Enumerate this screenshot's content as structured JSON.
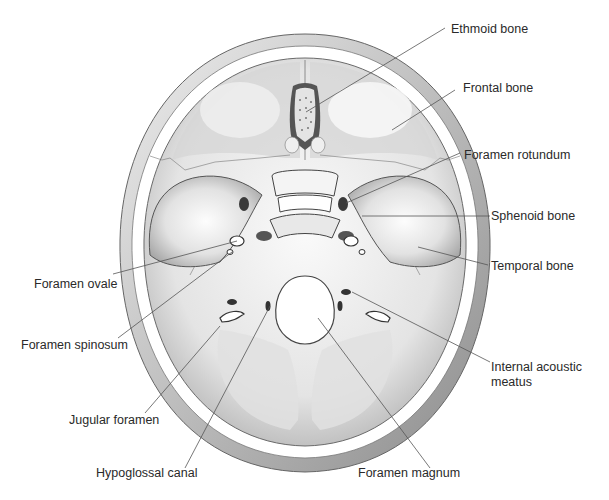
{
  "figure": {
    "colors": {
      "background": "#ffffff",
      "bone_light": "#f2f2f2",
      "bone_mid": "#c8c8c8",
      "bone_dark": "#8a8a8a",
      "leader_line": "#555555",
      "label_text": "#2a2a2a"
    }
  },
  "labels": {
    "ethmoid_bone": "Ethmoid bone",
    "frontal_bone": "Frontal bone",
    "foramen_rotundum": "Foramen rotundum",
    "sphenoid_bone": "Sphenoid bone",
    "temporal_bone": "Temporal bone",
    "internal_acoustic_meatus_1": "Internal acoustic",
    "internal_acoustic_meatus_2": "meatus",
    "foramen_ovale": "Foramen ovale",
    "foramen_spinosum": "Foramen spinosum",
    "jugular_foramen": "Jugular foramen",
    "hypoglossal_canal": "Hypoglossal canal",
    "foramen_magnum": "Foramen magnum"
  }
}
